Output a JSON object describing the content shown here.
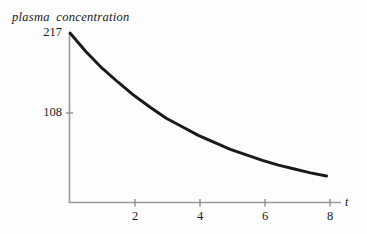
{
  "figure": {
    "background_color": "#fdfdfd",
    "curve_color": "#1a1a1a",
    "axis_color": "#9a9a9a",
    "text_color": "#161616"
  },
  "chart_data": {
    "type": "line",
    "title": "",
    "subtitle": "",
    "ylabel": "plasma concentration",
    "xlabel": "t",
    "legend": [],
    "legend_position": "none",
    "grid": false,
    "xlim": [
      0,
      8.45
    ],
    "ylim": [
      0,
      217
    ],
    "xticks": [
      2,
      4,
      6,
      8
    ],
    "xtick_labels": [
      "2",
      "4",
      "6",
      "8"
    ],
    "yticks": [
      108,
      217
    ],
    "ytick_labels": [
      "108",
      "217"
    ],
    "annotations": [],
    "series": [
      {
        "name": "plasma concentration",
        "model": "exponential decay C(t) = 217 * exp(-0.2310 * t)",
        "x": [
          0,
          0.5,
          1,
          1.5,
          2,
          2.5,
          3,
          3.5,
          4,
          4.5,
          5,
          5.5,
          6,
          6.5,
          7,
          7.5,
          8
        ],
        "y": [
          217,
          193,
          172,
          154,
          137,
          122,
          108,
          97,
          86,
          77,
          68,
          61,
          54,
          48,
          43,
          38,
          34
        ]
      }
    ]
  },
  "axes": {
    "y_axis_top_label": "217",
    "y_axis_mid_label": "108",
    "x_axis_label": "t",
    "y_axis_name": "plasma concentration"
  },
  "xtick_items": [
    {
      "label": "2",
      "left": 135
    },
    {
      "label": "4",
      "left": 200
    },
    {
      "label": "6",
      "left": 265
    },
    {
      "label": "8",
      "left": 330
    }
  ],
  "ytick_items": [
    {
      "label": "217",
      "top": 26
    },
    {
      "label": "108",
      "top": 106
    }
  ]
}
